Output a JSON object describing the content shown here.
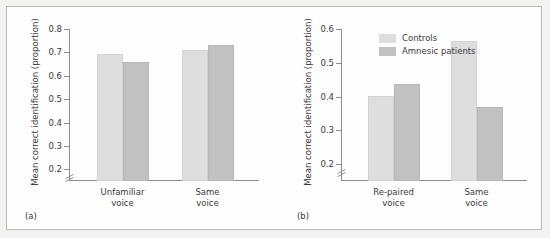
{
  "figure": {
    "background_color": "#fdfdfd",
    "border_color": "#b9b9b9",
    "colors": {
      "controls": "#dedede",
      "amnesic": "#c1c1c1",
      "axis": "#8d8d8d",
      "text": "#3b3b3b"
    }
  },
  "chart_data": [
    {
      "type": "bar",
      "panel_label": "(a)",
      "title": "",
      "xlabel": "",
      "ylabel": "Mean correct identification (proportion)",
      "categories": [
        "Unfamiliar\nvoice",
        "Same\nvoice"
      ],
      "category_labels_flat": [
        "Unfamiliar voice",
        "Same voice"
      ],
      "series": [
        {
          "name": "Controls",
          "values": [
            0.695,
            0.71
          ]
        },
        {
          "name": "Amnesic patients",
          "values": [
            0.66,
            0.73
          ]
        }
      ],
      "ylim": [
        0.15,
        0.8
      ],
      "yticks": [
        0.2,
        0.3,
        0.4,
        0.5,
        0.6,
        0.7,
        0.8
      ],
      "ytick_labels": [
        "0.2",
        "0.3",
        "0.4",
        "0.5",
        "0.6",
        "0.7",
        "0.8"
      ],
      "axis_break": true,
      "grid": false,
      "legend": false
    },
    {
      "type": "bar",
      "panel_label": "(b)",
      "title": "",
      "xlabel": "",
      "ylabel": "Mean correct identification (proportion)",
      "categories": [
        "Re-paired\nvoice",
        "Same\nvoice"
      ],
      "category_labels_flat": [
        "Re-paired voice",
        "Same voice"
      ],
      "series": [
        {
          "name": "Controls",
          "values": [
            0.401,
            0.565
          ]
        },
        {
          "name": "Amnesic patients",
          "values": [
            0.436,
            0.37
          ]
        }
      ],
      "ylim": [
        0.15,
        0.6
      ],
      "yticks": [
        0.2,
        0.3,
        0.4,
        0.5,
        0.6
      ],
      "ytick_labels": [
        "0.2",
        "0.3",
        "0.4",
        "0.5",
        "0.6"
      ],
      "axis_break": true,
      "grid": false,
      "legend": true,
      "legend_position": "top-left",
      "legend_entries": [
        "Controls",
        "Amnesic patients"
      ]
    }
  ]
}
